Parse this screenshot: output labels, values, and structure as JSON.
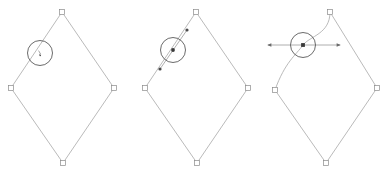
{
  "figure": {
    "type": "vector-editor-illustration",
    "panel_count": 3,
    "background_color": "#ffffff",
    "stroke_color": "#a8a8a8",
    "accent_color": "#4a4a4a",
    "caption": "",
    "panels": [
      {
        "id": "panel-1",
        "name": "diamond-with-cursor",
        "label": "",
        "description": "Diamond outline with pen cursor hovering on upper-left edge",
        "shape": {
          "kind": "polygon-diamond",
          "closed": true,
          "vertices": [
            {
              "name": "top",
              "x": 62,
              "y": 12
            },
            {
              "name": "right",
              "x": 114,
              "y": 88
            },
            {
              "name": "bottom",
              "x": 63,
              "y": 163
            },
            {
              "name": "left",
              "x": 11,
              "y": 88
            }
          ],
          "path": "M 62 12 L 114 88 L 63 163 L 11 88 Z"
        },
        "cursor": {
          "cx": 40,
          "cy": 53,
          "r": 12.5
        },
        "center_marker": {
          "type": "pen-tip",
          "x": 40,
          "y": 53
        },
        "handles": []
      },
      {
        "id": "panel-2",
        "name": "diamond-with-new-node",
        "label": "",
        "description": "Diamond with a node inserted on the upper-left edge showing a diagonal tangent handle",
        "shape": {
          "kind": "polygon-diamond",
          "closed": true,
          "vertices": [
            {
              "name": "top",
              "x": 196,
              "y": 12
            },
            {
              "name": "right",
              "x": 248,
              "y": 88
            },
            {
              "name": "bottom",
              "x": 197,
              "y": 163
            },
            {
              "name": "left",
              "x": 145,
              "y": 88
            }
          ],
          "path": "M 196 12 L 248 88 L 197 163 L 145 88 Z"
        },
        "cursor": {
          "cx": 173,
          "cy": 50,
          "r": 12.5
        },
        "center_marker": {
          "type": "node-dot",
          "x": 173,
          "y": 50
        },
        "handles": [
          {
            "name": "diagonal-tangent",
            "orientation": "diagonal",
            "x1": 160,
            "y1": 69,
            "x2": 187,
            "y2": 30,
            "endpoints": [
              {
                "name": "handle-dot-lower-left",
                "x": 160,
                "y": 69
              },
              {
                "name": "handle-dot-upper-right",
                "x": 187,
                "y": 30
              }
            ]
          }
        ]
      },
      {
        "id": "panel-3",
        "name": "diamond-with-smooth-node",
        "label": "",
        "description": "Node converted to smooth, horizontal handle pulled out making the two adjacent edges curve",
        "shape": {
          "kind": "diamond-with-curve",
          "closed": true,
          "path": "M 330 12 C 330 34 310 36 303 45 C 296 55 285 62 275 90 L 326 163 L 377 88 Z",
          "vertices": [
            {
              "name": "top",
              "x": 330,
              "y": 12
            },
            {
              "name": "right",
              "x": 377,
              "y": 88
            },
            {
              "name": "bottom",
              "x": 326,
              "y": 163
            },
            {
              "name": "left",
              "x": 275,
              "y": 90
            }
          ]
        },
        "cursor": {
          "cx": 303,
          "cy": 45,
          "r": 12.5
        },
        "center_marker": {
          "type": "node-square",
          "x": 303,
          "y": 45
        },
        "handles": [
          {
            "name": "horizontal-tangent",
            "orientation": "horizontal",
            "x1": 268,
            "y1": 45,
            "x2": 340,
            "y2": 45,
            "endpoints": [
              {
                "name": "handle-arrow-left",
                "x": 268,
                "y": 45
              },
              {
                "name": "handle-arrow-right",
                "x": 340,
                "y": 45
              }
            ]
          }
        ]
      }
    ]
  }
}
